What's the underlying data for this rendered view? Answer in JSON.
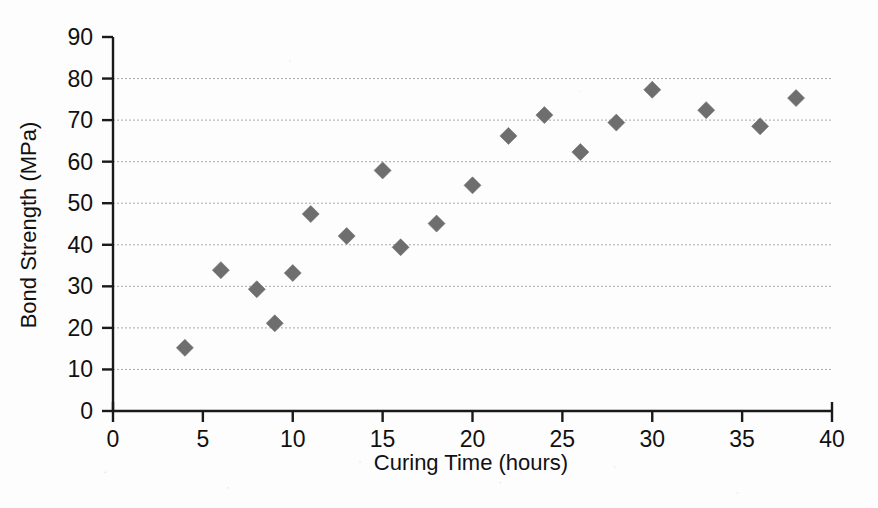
{
  "chart_data": {
    "type": "scatter",
    "title": "",
    "xlabel": "Curing Time (hours)",
    "ylabel": "Bond Strength (MPa)",
    "xlim": [
      0,
      40
    ],
    "ylim": [
      0,
      90
    ],
    "xticks": [
      0,
      5,
      10,
      15,
      20,
      25,
      30,
      35,
      40
    ],
    "yticks": [
      0,
      10,
      20,
      30,
      40,
      50,
      60,
      70,
      80,
      90
    ],
    "grid": "horizontal-dotted",
    "legend": "none",
    "marker": "diamond",
    "marker_color": "#6e6e6e",
    "x": [
      4,
      6,
      8,
      9,
      10,
      11,
      13,
      15,
      16,
      18,
      20,
      22,
      24,
      26,
      28,
      30,
      33,
      36,
      38
    ],
    "y": [
      15.2,
      33.9,
      29.3,
      21.1,
      33.2,
      47.4,
      42.1,
      57.9,
      39.4,
      45.1,
      54.3,
      66.2,
      71.2,
      62.3,
      69.4,
      77.3,
      72.4,
      68.5,
      75.3
    ],
    "points": [
      {
        "x": 4,
        "y": 15.2
      },
      {
        "x": 6,
        "y": 33.9
      },
      {
        "x": 8,
        "y": 29.3
      },
      {
        "x": 9,
        "y": 21.1
      },
      {
        "x": 10,
        "y": 33.2
      },
      {
        "x": 11,
        "y": 47.4
      },
      {
        "x": 13,
        "y": 42.1
      },
      {
        "x": 15,
        "y": 57.9
      },
      {
        "x": 16,
        "y": 39.4
      },
      {
        "x": 18,
        "y": 45.1
      },
      {
        "x": 20,
        "y": 54.3
      },
      {
        "x": 22,
        "y": 66.2
      },
      {
        "x": 24,
        "y": 71.2
      },
      {
        "x": 26,
        "y": 62.3
      },
      {
        "x": 28,
        "y": 69.4
      },
      {
        "x": 30,
        "y": 77.3
      },
      {
        "x": 33,
        "y": 72.4
      },
      {
        "x": 36,
        "y": 68.5
      },
      {
        "x": 38,
        "y": 75.3
      }
    ]
  },
  "axes": {
    "x_tick_labels": [
      "0",
      "5",
      "10",
      "15",
      "20",
      "25",
      "30",
      "35",
      "40"
    ],
    "y_tick_labels": [
      "0",
      "10",
      "20",
      "30",
      "40",
      "50",
      "60",
      "70",
      "80",
      "90"
    ],
    "x_title": "Curing Time (hours)",
    "y_title": "Bond Strength (MPa)"
  },
  "style": {
    "axis_color": "#1a1a1a",
    "grid_color": "#9a9a9a",
    "marker_color": "#6e6e6e",
    "background": "#fdfdfd"
  }
}
